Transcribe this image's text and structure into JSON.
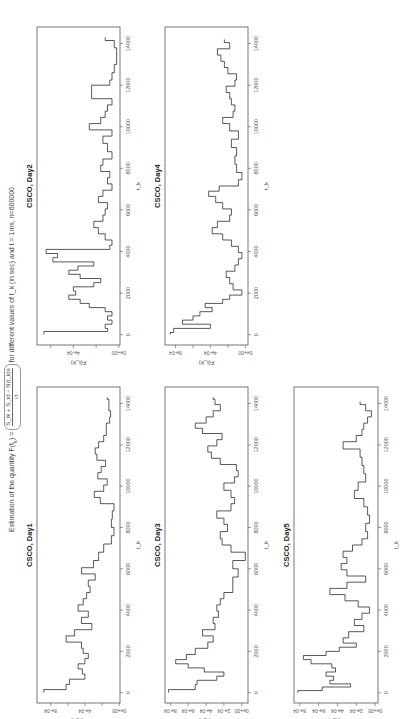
{
  "header": {
    "title_prefix": "Estimation of the quantity  F(t",
    "title_sub": "k",
    "title_eq": ") =",
    "frac_num": "S_tk + S_td − N(t_k)s",
    "frac_den": "√t",
    "title_suffix": "for different values of  t_k (in sec) and t = 1ms, n=600000"
  },
  "axis": {
    "xlabel": "t_k",
    "ylabel": "F(t_k)",
    "xticks": [
      0,
      2000,
      4000,
      6000,
      8000,
      10000,
      12000,
      14000
    ],
    "xlim": [
      -500,
      14800
    ]
  },
  "caption": "Fig. Estimation of F(t_k) for CSCO, days 1–5 (partially cropped)",
  "chart_data": [
    {
      "type": "line",
      "title": "CSCO, Day1",
      "xlabel": "t_k",
      "ylabel": "F(t_k)",
      "ylim": [
        -1e-05,
        0.00096
      ],
      "yticks": [
        0,
        0.0002,
        0.0004,
        0.0006,
        0.0008
      ],
      "ytick_labels": [
        "0e+00",
        "",
        "4e-04",
        "",
        "8e-04"
      ],
      "x": [
        0,
        300,
        500,
        800,
        1000,
        1300,
        1500,
        1800,
        2000,
        2300,
        2600,
        2900,
        3200,
        3500,
        3800,
        4100,
        4400,
        4700,
        5000,
        5300,
        5600,
        5900,
        6200,
        6600,
        7000,
        7400,
        7800,
        8200,
        8600,
        9000,
        9300,
        9600,
        9900,
        10200,
        10500,
        10800,
        11100,
        11400,
        11700,
        12000,
        12300,
        12600,
        12900,
        13200,
        13500,
        13800,
        14100,
        14300
      ],
      "values": [
        0.00088,
        0.00062,
        0.00058,
        0.0004,
        0.00043,
        0.00048,
        0.0004,
        0.00036,
        0.00042,
        0.00044,
        0.00062,
        0.00052,
        0.00032,
        0.00044,
        0.00036,
        0.00048,
        0.00042,
        0.00038,
        0.00034,
        0.00036,
        0.00028,
        0.00044,
        0.0003,
        0.00024,
        0.00018,
        9e-05,
        6e-05,
        9e-05,
        8e-05,
        6e-05,
        0.00022,
        0.00029,
        0.00018,
        0.00014,
        0.00025,
        0.00021,
        0.00016,
        0.00026,
        0.00028,
        0.00024,
        0.00018,
        0.00015,
        0.00015,
        0.00011,
        0.0001,
        0.00012,
        0.00012,
        0.00014
      ]
    },
    {
      "type": "line",
      "title": "CSCO, Day2",
      "xlabel": "t_k",
      "ylabel": "F(t_k)",
      "ylim": [
        -1e-05,
        0.00072
      ],
      "yticks": [
        0,
        0.0002,
        0.0004,
        0.0006
      ],
      "ytick_labels": [
        "0e+00",
        "",
        "4e-04",
        ""
      ],
      "x": [
        0,
        100,
        200,
        400,
        600,
        800,
        1000,
        1200,
        1400,
        1600,
        1800,
        2000,
        2200,
        2400,
        2600,
        2800,
        3000,
        3200,
        3400,
        3600,
        3800,
        4000,
        4200,
        4400,
        4700,
        5000,
        5300,
        5600,
        5900,
        6200,
        6500,
        6800,
        7100,
        7400,
        7700,
        8000,
        8300,
        8600,
        9000,
        9400,
        9700,
        10000,
        10300,
        10600,
        10900,
        11200,
        11500,
        11900,
        12100,
        12400,
        12800,
        13200,
        13600,
        14000,
        14300
      ],
      "values": [
        0.00066,
        0.00066,
        0.0001,
        0.00012,
        6e-05,
        0.0001,
        6e-05,
        0.00012,
        0.00026,
        0.00034,
        0.00044,
        0.00038,
        0.0004,
        0.00022,
        0.00016,
        0.00034,
        0.00044,
        0.00036,
        0.00022,
        0.00058,
        0.00054,
        0.00064,
        8e-05,
        6e-05,
        0.00012,
        0.00018,
        0.00022,
        0.00014,
        0.00012,
        0.0001,
        0.00018,
        0.00014,
        6e-05,
        0.0001,
        8e-05,
        0.00016,
        0.00014,
        6e-05,
        0.0001,
        0.00014,
        6e-05,
        0.00026,
        0.00016,
        0.00012,
        0.0001,
        6e-05,
        0.00024,
        0.00024,
        8e-05,
        6e-05,
        4e-05,
        2e-05,
        2e-05,
        4e-05,
        0.00012
      ]
    },
    {
      "type": "line",
      "title": "CSCO, Day3",
      "xlabel": "t_k",
      "ylabel": "F(t_k)",
      "ylim": [
        -7e-05,
        0.00086
      ],
      "yticks": [
        0,
        0.0002,
        0.0004,
        0.0006,
        0.0008
      ],
      "ytick_labels": [
        "0e+00",
        "2e-04",
        "4e-04",
        "6e-04",
        "8e-04"
      ],
      "x": [
        0,
        300,
        500,
        700,
        900,
        1100,
        1300,
        1500,
        1700,
        2000,
        2300,
        2600,
        2900,
        3200,
        3500,
        3800,
        4100,
        4400,
        4700,
        5000,
        5400,
        5800,
        6200,
        6600,
        7000,
        7300,
        7600,
        8000,
        8300,
        8600,
        9000,
        9300,
        9600,
        10000,
        10300,
        10600,
        10900,
        11200,
        11500,
        11800,
        12100,
        12400,
        12700,
        12900,
        13200,
        13500,
        13800,
        14100,
        14300
      ],
      "values": [
        0.00082,
        0.00052,
        0.0005,
        0.00028,
        0.0002,
        0.00042,
        0.0006,
        0.00074,
        0.00062,
        0.00052,
        0.00038,
        0.00032,
        0.00044,
        0.0003,
        0.00032,
        0.00026,
        0.00028,
        0.00024,
        0.0002,
        0.0001,
        0.0001,
        4e-05,
        0.0001,
        -4e-05,
        0.00012,
        0.00022,
        0.00024,
        0.00016,
        0.0002,
        0.00028,
        0.00012,
        8e-05,
        0.00012,
        0.0002,
        8e-05,
        4e-05,
        6e-05,
        0.00024,
        0.00034,
        0.00038,
        0.00028,
        0.00022,
        0.00044,
        0.00052,
        0.0004,
        0.00032,
        0.00024,
        0.0003,
        0.00032
      ]
    },
    {
      "type": "line",
      "title": "CSCO, Day4",
      "xlabel": "t_k",
      "ylabel": "F(t_k)",
      "ylim": [
        -3e-05,
        0.00092
      ],
      "yticks": [
        0,
        0.0002,
        0.0004,
        0.0006,
        0.0008
      ],
      "ytick_labels": [
        "0e+00",
        "",
        "4e-04",
        "",
        "8e-04"
      ],
      "x": [
        0,
        200,
        400,
        600,
        800,
        1000,
        1200,
        1400,
        1600,
        1800,
        2000,
        2300,
        2600,
        2900,
        3200,
        3500,
        3800,
        4100,
        4400,
        4700,
        5000,
        5300,
        5600,
        5900,
        6200,
        6500,
        6800,
        7000,
        7300,
        7600,
        8000,
        8400,
        8800,
        9200,
        9600,
        10000,
        10300,
        10600,
        10900,
        11200,
        11500,
        11800,
        12100,
        12400,
        12700,
        13000,
        13300,
        13600,
        13900,
        14200
      ],
      "values": [
        0.00086,
        0.00082,
        0.0004,
        0.00072,
        0.0006,
        0.00052,
        0.00038,
        0.00046,
        0.00026,
        0.00018,
        4e-05,
        0.00014,
        0.00018,
        0.00022,
        0.00012,
        8e-05,
        4e-05,
        8e-05,
        0.00016,
        0.00026,
        0.00038,
        0.00032,
        0.00018,
        0.00016,
        0.00026,
        0.00034,
        0.00042,
        0.0003,
        8e-05,
        4e-05,
        0.0001,
        0.00012,
        0.0001,
        0.00016,
        8e-05,
        0.00018,
        0.00026,
        0.00014,
        0.00012,
        0.00016,
        0.00018,
        0.00022,
        0.00012,
        0.0001,
        0.0002,
        0.00024,
        0.00028,
        0.00032,
        0.00018,
        0.00024
      ]
    },
    {
      "type": "line",
      "title": "CSCO, Day5",
      "xlabel": "t_k",
      "ylabel": "F(t_k)",
      "ylim": [
        -3e-05,
        0.00086
      ],
      "yticks": [
        0,
        0.0002,
        0.0004,
        0.0006,
        0.0008
      ],
      "ytick_labels": [
        "0e+00",
        "2e-04",
        "4e-04",
        "6e-04",
        "8e-04"
      ],
      "x": [
        0,
        200,
        350,
        500,
        700,
        900,
        1100,
        1300,
        1500,
        1700,
        1900,
        2100,
        2300,
        2500,
        2800,
        3100,
        3400,
        3700,
        4000,
        4300,
        4600,
        4900,
        5200,
        5500,
        5800,
        6100,
        6400,
        6700,
        7000,
        7300,
        7600,
        8000,
        8400,
        8800,
        9200,
        9600,
        10000,
        10400,
        10800,
        11200,
        11600,
        12000,
        12300,
        12600,
        12900,
        13200,
        13500,
        13800,
        14100
      ],
      "values": [
        0.00082,
        0.00056,
        0.00026,
        0.00048,
        0.00044,
        0.00052,
        0.00042,
        0.00046,
        0.00068,
        0.00076,
        0.00052,
        0.00038,
        0.0002,
        0.00034,
        0.00028,
        0.00012,
        0.00022,
        0.00014,
        6e-05,
        0.00018,
        0.00032,
        0.00048,
        0.0003,
        0.0001,
        0.0003,
        0.00036,
        0.0003,
        0.00034,
        0.00024,
        0.00014,
        8e-05,
        0.0001,
        6e-05,
        8e-05,
        0.00012,
        0.00022,
        0.00018,
        0.0001,
        0.00012,
        0.00014,
        0.00016,
        0.00034,
        0.0002,
        0.00014,
        0.00012,
        8e-05,
        4e-05,
        0.0001,
        0.00016
      ]
    }
  ],
  "layout": {
    "panels": [
      {
        "index": 1,
        "left": 18,
        "top": 37,
        "w": 316,
        "h": 83
      },
      {
        "index": 0,
        "left": 16,
        "top": 37,
        "w": 316,
        "h": 83,
        "col": 1
      },
      {
        "index": 3,
        "left": 18,
        "top": 165,
        "w": 316,
        "h": 83
      },
      {
        "index": 2,
        "left": 16,
        "top": 165,
        "w": 316,
        "h": 83,
        "col": 1
      },
      {
        "index": 4,
        "left": 16,
        "top": 294,
        "w": 316,
        "h": 84,
        "col": 1
      }
    ]
  }
}
